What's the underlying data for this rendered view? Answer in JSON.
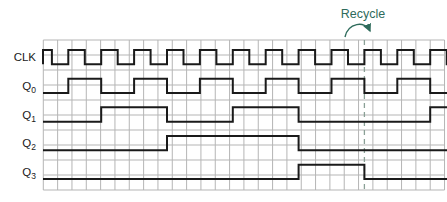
{
  "annotation": {
    "label": "Recycle",
    "color": "#2e6b5b",
    "dashed_line_x": 364.4
  },
  "colors": {
    "waveform": "#1a1a1a",
    "grid": "#b5b5b5",
    "dashed_line": "#8aa096",
    "label_text": "#1a1a1a"
  },
  "plot": {
    "x_start": 43,
    "x_end": 447,
    "grid_x0": 43.3,
    "grid_col_width": 14.33,
    "grid_cols": 28,
    "grid_y0": 40,
    "grid_row_height": 15,
    "grid_rows": 10
  },
  "signals": [
    {
      "name": "CLK",
      "label": "CLK",
      "sub": "",
      "row": 0,
      "initial": "high",
      "leading_edge": true,
      "transitions": [
        51.9,
        68.3,
        84.8,
        101.2,
        117.7,
        134.1,
        150.6,
        167.0,
        183.5,
        199.9,
        216.4,
        232.8,
        249.3,
        265.7,
        282.2,
        298.6,
        315.1,
        331.5,
        348.0,
        364.4,
        380.9,
        397.3,
        413.8,
        430.2,
        446.7
      ]
    },
    {
      "name": "Q0",
      "label": "Q",
      "sub": "0",
      "row": 1,
      "initial": "low",
      "leading_edge": false,
      "transitions": [
        68.3,
        101.2,
        134.1,
        167.0,
        199.9,
        232.8,
        265.7,
        298.6,
        331.5,
        364.4,
        397.3,
        430.2
      ]
    },
    {
      "name": "Q1",
      "label": "Q",
      "sub": "1",
      "row": 2,
      "initial": "low",
      "leading_edge": false,
      "transitions": [
        101.2,
        167.0,
        232.8,
        298.6,
        430.2
      ]
    },
    {
      "name": "Q2",
      "label": "Q",
      "sub": "2",
      "row": 3,
      "initial": "low",
      "leading_edge": false,
      "transitions": [
        167.0,
        298.6
      ]
    },
    {
      "name": "Q3",
      "label": "Q",
      "sub": "3",
      "row": 4,
      "initial": "low",
      "leading_edge": false,
      "transitions": [
        298.6,
        364.4
      ]
    }
  ]
}
